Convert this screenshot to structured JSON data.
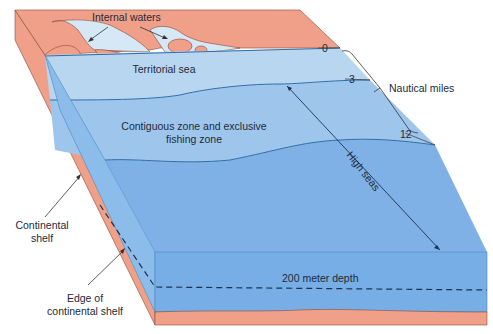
{
  "diagram": {
    "colors": {
      "land": "#f0a088",
      "land_edge": "#8a4a3a",
      "internal_waters": "#d6e8f6",
      "territorial_sea": "#b9d6f0",
      "contiguous_zone": "#9ec6ec",
      "high_seas": "#7fb1e6",
      "front_face": "#78aee6",
      "side_face": "#8cbdea",
      "line": "#1b3350"
    },
    "labels": {
      "internal_waters": "Internal waters",
      "territorial_sea": "Territorial sea",
      "contiguous_line1": "Contiguous zone and exclusive",
      "contiguous_line2": "fishing zone",
      "high_seas": "High seas",
      "nautical_miles": "Nautical miles",
      "continental_shelf_line1": "Continental",
      "continental_shelf_line2": "shelf",
      "edge_line1": "Edge of",
      "edge_line2": "continental shelf",
      "depth": "200 meter depth"
    },
    "distance_markers": [
      "0",
      "3",
      "12"
    ]
  }
}
